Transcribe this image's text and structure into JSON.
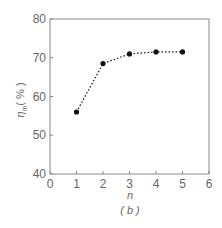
{
  "chart_data": {
    "type": "line",
    "title": "",
    "caption": "( b )",
    "xlabel": "n",
    "ylabel": "η_m ( % )",
    "ylabel_main": "η",
    "ylabel_sub": "m",
    "ylabel_unit": "( % )",
    "xlim": [
      0,
      6
    ],
    "ylim": [
      40,
      80
    ],
    "x_ticks": [
      0,
      1,
      2,
      3,
      4,
      5,
      6
    ],
    "y_ticks": [
      40,
      50,
      60,
      70,
      80
    ],
    "grid": false,
    "legend": null,
    "series": [
      {
        "name": "η_m",
        "line_style": "dotted",
        "marker": "circle",
        "x": [
          1,
          2,
          3,
          4,
          5
        ],
        "values": [
          56,
          68.5,
          71,
          71.5,
          71.5
        ]
      }
    ],
    "colors": {
      "axis": "#888888",
      "series": "#111111",
      "text": "#666666"
    }
  }
}
